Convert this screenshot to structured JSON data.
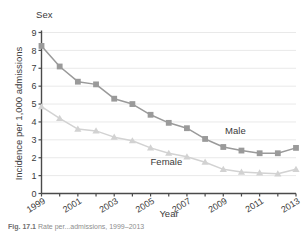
{
  "figure": {
    "legend_title": "Sex",
    "caption_prefix": "Fig. 17.1",
    "caption_text": "Rate per...admissions, 1999–2013"
  },
  "chart_data": {
    "type": "line",
    "title": "",
    "xlabel": "Year",
    "ylabel": "Incidence per 1,000 admissions",
    "xlim": [
      1999,
      2013
    ],
    "ylim": [
      0,
      9
    ],
    "grid": true,
    "legend_position": "inline-annotations",
    "x": [
      1999,
      2000,
      2001,
      2002,
      2003,
      2004,
      2005,
      2006,
      2007,
      2008,
      2009,
      2010,
      2011,
      2012,
      2013
    ],
    "xticks": [
      1999,
      2000,
      2001,
      2002,
      2003,
      2004,
      2005,
      2006,
      2007,
      2008,
      2009,
      2010,
      2011,
      2012,
      2013
    ],
    "xticklabels": [
      "1999",
      "",
      "2001",
      "",
      "2003",
      "",
      "2005",
      "",
      "2007",
      "",
      "2009",
      "",
      "2011",
      "",
      "2013"
    ],
    "yticks": [
      0,
      1,
      2,
      3,
      4,
      5,
      6,
      7,
      8,
      9
    ],
    "yticklabels": [
      "0",
      "1",
      "2",
      "3",
      "4",
      "5",
      "6",
      "7",
      "8",
      "9"
    ],
    "series": [
      {
        "name": "Male",
        "marker": "square",
        "color": "#9a9a9a",
        "values": [
          8.25,
          7.1,
          6.25,
          6.1,
          5.3,
          5.0,
          4.4,
          3.95,
          3.65,
          3.05,
          2.6,
          2.4,
          2.25,
          2.25,
          2.55
        ],
        "label_text": "Male",
        "label_x": 2009.1,
        "label_y": 3.35
      },
      {
        "name": "Female",
        "marker": "triangle",
        "color": "#d2d2d2",
        "values": [
          4.85,
          4.2,
          3.6,
          3.5,
          3.15,
          2.95,
          2.55,
          2.25,
          2.05,
          1.75,
          1.35,
          1.2,
          1.15,
          1.1,
          1.35
        ],
        "label_text": "Female",
        "label_x": 2005.0,
        "label_y": 1.62
      }
    ]
  },
  "colors": {
    "male": "#9a9a9a",
    "female": "#d2d2d2",
    "axis": "#4a4a4a",
    "grid": "#e9e9e9",
    "text": "#3a3a3a"
  }
}
